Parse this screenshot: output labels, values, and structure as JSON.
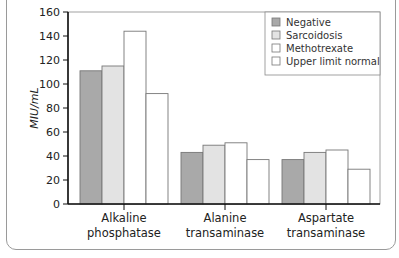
{
  "chart_data": {
    "type": "bar",
    "title": "",
    "xlabel": "",
    "ylabel": "MIU/mL",
    "ylim": [
      0,
      160
    ],
    "yticks": [
      0,
      20,
      40,
      60,
      80,
      100,
      120,
      140,
      160
    ],
    "grid": false,
    "legend_position": "upper right",
    "categories": [
      "Alkaline phosphatase",
      "Alanine transaminase",
      "Aspartate transaminase"
    ],
    "category_lines": [
      [
        "Alkaline",
        "phosphatase"
      ],
      [
        "Alanine",
        "transaminase"
      ],
      [
        "Aspartate",
        "transaminase"
      ]
    ],
    "series": [
      {
        "name": "Negative",
        "color": "#a9a9a9",
        "values": [
          111,
          43,
          37
        ]
      },
      {
        "name": "Sarcoidosis",
        "color": "#e3e3e3",
        "values": [
          115,
          49,
          43
        ]
      },
      {
        "name": "Methotrexate",
        "color": "#ffffff",
        "values": [
          144,
          51,
          45
        ]
      },
      {
        "name": "Upper limit normal",
        "color": "#ffffff",
        "values": [
          92,
          37,
          29
        ]
      }
    ]
  }
}
